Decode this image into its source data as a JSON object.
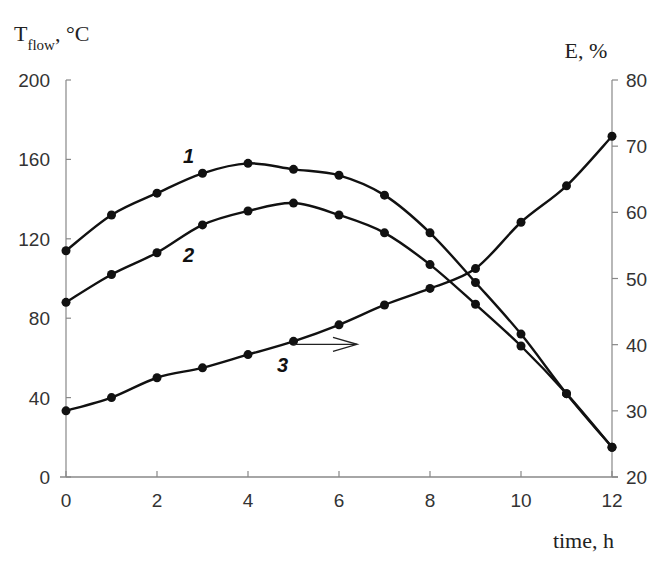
{
  "chart_data": {
    "type": "line",
    "title": "",
    "xlabel": "time, h",
    "ylabel_left": "T_flow, °C",
    "ylabel_right": "E, %",
    "left_axis": {
      "title_main": "T",
      "title_sub": "flow",
      "title_rest": ", °C",
      "range": [
        0,
        200
      ],
      "ticks": [
        "0",
        "40",
        "80",
        "120",
        "160",
        "200"
      ]
    },
    "right_axis": {
      "title": "E, %",
      "range": [
        20,
        80
      ],
      "ticks": [
        "20",
        "30",
        "40",
        "50",
        "60",
        "70",
        "80"
      ]
    },
    "x_axis": {
      "title": "time, h",
      "range": [
        0,
        12
      ],
      "ticks": [
        "0",
        "2",
        "4",
        "6",
        "8",
        "10",
        "12"
      ]
    },
    "grid": false,
    "legend": "inline curve labels 1, 2, 3",
    "x": [
      0,
      1,
      2,
      3,
      4,
      5,
      6,
      7,
      8,
      9,
      10,
      11,
      12
    ],
    "series": [
      {
        "name": "1",
        "axis": "left",
        "values": [
          114,
          132,
          143,
          153,
          158,
          155,
          152,
          142,
          123,
          98,
          72,
          42,
          15
        ]
      },
      {
        "name": "2",
        "axis": "left",
        "values": [
          88,
          102,
          113,
          127,
          134,
          138,
          132,
          123,
          107,
          87,
          66,
          42,
          15
        ]
      },
      {
        "name": "3",
        "axis": "right",
        "values": [
          30,
          32,
          35,
          36.5,
          38.5,
          40.5,
          43,
          46,
          48.5,
          51.5,
          58.5,
          64,
          71.5
        ]
      }
    ],
    "annotations": [
      {
        "text": "1",
        "x": 3.5,
        "near_series": "1"
      },
      {
        "text": "2",
        "x": 2.6,
        "near_series": "2"
      },
      {
        "text": "3",
        "x": 5.0,
        "near_series": "3"
      },
      {
        "text": "arrow pointing right",
        "from_x": 5,
        "to_x": 6.7,
        "meaning": "curve 3 uses right axis"
      }
    ]
  }
}
